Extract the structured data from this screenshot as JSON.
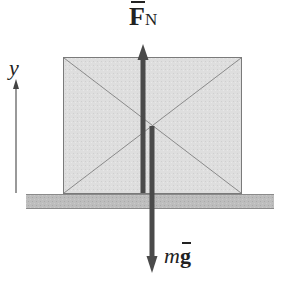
{
  "diagram": {
    "labels": {
      "normal_force": {
        "symbol": "F",
        "subscript": "N",
        "vector": true
      },
      "gravity": {
        "mass": "m",
        "accel": "g",
        "vector": true
      },
      "axis": "y"
    },
    "elements": {
      "block": {
        "x": 63,
        "y": 57,
        "width": 178,
        "height": 136,
        "fill": "#dcdcdc",
        "stroke": "#7a7a7a"
      },
      "ground": {
        "x": 26,
        "y": 194,
        "width": 248,
        "height": 15,
        "fill": "#b8b8b8"
      },
      "normal_arrow": {
        "direction": "up",
        "x": 143,
        "from_y": 193,
        "to_y": 44,
        "color": "#4a4a4a"
      },
      "gravity_arrow": {
        "direction": "down",
        "x": 152,
        "from_y": 126,
        "to_y": 272,
        "color": "#4a4a4a"
      },
      "y_axis_arrow": {
        "direction": "up",
        "x": 16,
        "from_y": 193,
        "to_y": 80,
        "color": "#555555"
      }
    }
  }
}
